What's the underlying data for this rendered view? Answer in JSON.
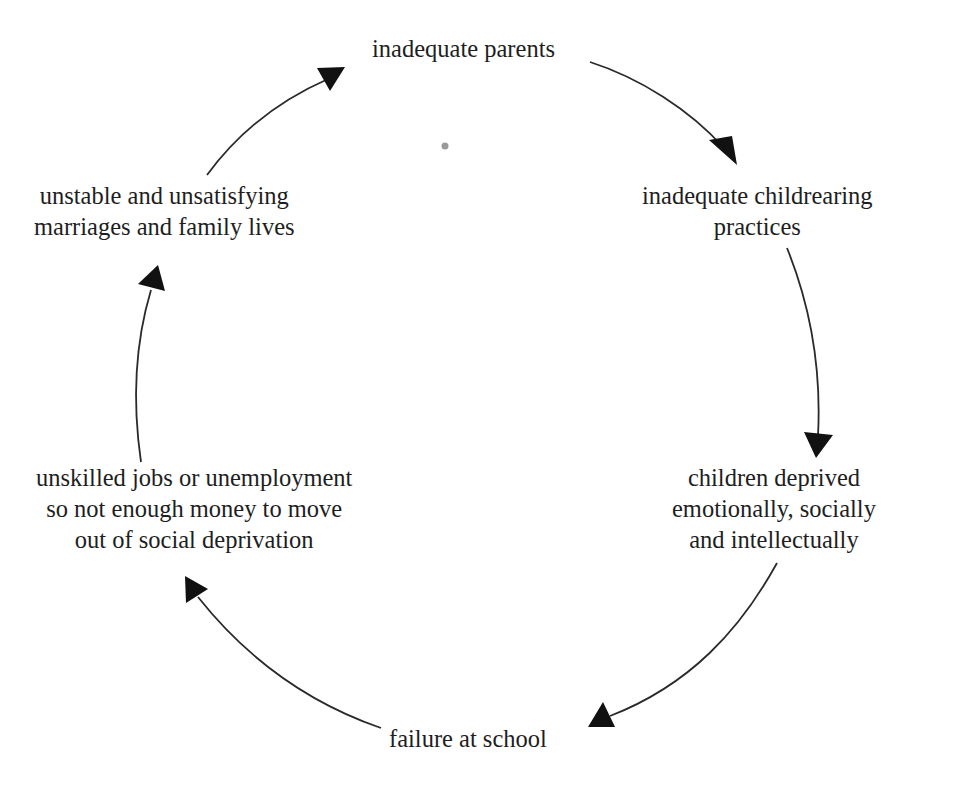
{
  "diagram": {
    "type": "cycle",
    "nodes": [
      {
        "id": "parents",
        "lines": [
          "inadequate parents"
        ]
      },
      {
        "id": "childrearing",
        "lines": [
          "inadequate childrearing",
          "practices"
        ]
      },
      {
        "id": "deprived",
        "lines": [
          "children deprived",
          "emotionally, socially",
          "and intellectually"
        ]
      },
      {
        "id": "school",
        "lines": [
          "failure at school"
        ]
      },
      {
        "id": "jobs",
        "lines": [
          "unskilled jobs or unemployment",
          "so not enough money to move",
          "out of social deprivation"
        ]
      },
      {
        "id": "marriages",
        "lines": [
          "unstable and unsatisfying",
          "marriages and family lives"
        ]
      }
    ],
    "edges": [
      {
        "from": "parents",
        "to": "childrearing"
      },
      {
        "from": "childrearing",
        "to": "deprived"
      },
      {
        "from": "deprived",
        "to": "school"
      },
      {
        "from": "school",
        "to": "jobs"
      },
      {
        "from": "jobs",
        "to": "marriages"
      },
      {
        "from": "marriages",
        "to": "parents"
      }
    ],
    "colors": {
      "text": "#1e1e1e",
      "arrow": "#111111",
      "background": "#ffffff"
    }
  }
}
